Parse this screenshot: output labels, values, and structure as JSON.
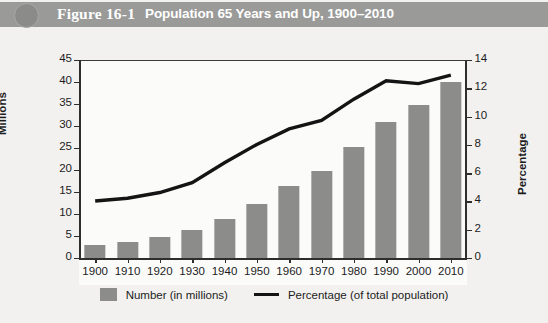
{
  "header": {
    "figure_number": "Figure 16-1",
    "title": "Population 65 Years and Up, 1900–2010",
    "bar_color": "#9a9a99",
    "text_color": "#ffffff"
  },
  "colors": {
    "bar": "#8c8c8b",
    "line": "#141414",
    "axis": "#2e2e2e",
    "plot_background": "#fbfbfa",
    "page_background": "#f2f1ef"
  },
  "chart_data": {
    "type": "bar",
    "title": "Population 65 Years and Up, 1900–2010",
    "categories": [
      "1900",
      "1910",
      "1920",
      "1930",
      "1940",
      "1950",
      "1960",
      "1970",
      "1980",
      "1990",
      "2000",
      "2010"
    ],
    "series": [
      {
        "name": "Number (in millions)",
        "type": "bar",
        "axis": "left",
        "values": [
          3.1,
          3.9,
          4.9,
          6.6,
          9.0,
          12.4,
          16.6,
          20.1,
          25.5,
          31.1,
          35.0,
          40.3
        ]
      },
      {
        "name": "Percentage (of total population)",
        "type": "line",
        "axis": "right",
        "values": [
          4.1,
          4.3,
          4.7,
          5.4,
          6.8,
          8.1,
          9.2,
          9.8,
          11.3,
          12.6,
          12.4,
          13.0
        ]
      }
    ],
    "xlabel": "",
    "ylabel": "Millions",
    "ylabel_right": "Percentage",
    "ylim": [
      0,
      45
    ],
    "yticks": [
      0,
      5,
      10,
      15,
      20,
      25,
      30,
      35,
      40,
      45
    ],
    "ylim_right": [
      0,
      14
    ],
    "yticks_right": [
      0,
      2,
      4,
      6,
      8,
      10,
      12,
      14
    ],
    "grid": false,
    "legend_position": "bottom"
  },
  "legend": {
    "bar_label": "Number (in millions)",
    "line_label": "Percentage (of total population)"
  }
}
